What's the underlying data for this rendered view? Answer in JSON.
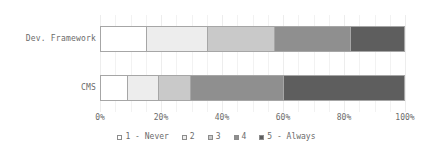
{
  "chart_data": {
    "type": "bar",
    "orientation": "horizontal",
    "stacked": true,
    "stack_mode": "percent",
    "title": "",
    "xlabel": "",
    "ylabel": "",
    "categories": [
      "Dev. Framework",
      "CMS"
    ],
    "xticklabels": [
      "0%",
      "20%",
      "40%",
      "60%",
      "80%",
      "100%"
    ],
    "xtickvalues": [
      0,
      20,
      40,
      60,
      80,
      100
    ],
    "xlim": [
      0,
      100
    ],
    "grid": true,
    "grid_axis": "x",
    "legend_position": "bottom",
    "series": [
      {
        "name": "1 - Never",
        "color": "#ffffff",
        "values": [
          15,
          9
        ]
      },
      {
        "name": "2",
        "color": "#ededed",
        "values": [
          20,
          10
        ]
      },
      {
        "name": "3",
        "color": "#c9c9c9",
        "values": [
          22,
          10.5
        ]
      },
      {
        "name": "4",
        "color": "#8f8f8f",
        "values": [
          25,
          30.5
        ]
      },
      {
        "name": "5 - Always",
        "color": "#5e5e5e",
        "values": [
          18,
          40
        ]
      }
    ]
  },
  "axis": {
    "ticks": [
      {
        "label": "0%",
        "value": 0
      },
      {
        "label": "20%",
        "value": 20
      },
      {
        "label": "40%",
        "value": 40
      },
      {
        "label": "60%",
        "value": 60
      },
      {
        "label": "80%",
        "value": 80
      },
      {
        "label": "100%",
        "value": 100
      }
    ]
  },
  "legend": {
    "items": [
      {
        "label": "1 - Never",
        "color": "#ffffff"
      },
      {
        "label": "2",
        "color": "#ededed"
      },
      {
        "label": "3",
        "color": "#c9c9c9"
      },
      {
        "label": "4",
        "color": "#8f8f8f"
      },
      {
        "label": "5 - Always",
        "color": "#5e5e5e"
      }
    ]
  },
  "style": {
    "segment_border": "#a6a6a6",
    "gridline_color": "#f2f2f2",
    "text_color": "#6b6b6b",
    "background": "#ffffff"
  }
}
